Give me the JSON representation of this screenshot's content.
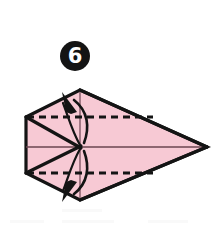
{
  "figure": {
    "kind": "origami-instruction-diagram",
    "step_number": "6",
    "step_badge": {
      "label": "6",
      "shape": "filled-circle",
      "fill_color": "#141414",
      "text_color": "#ffffff",
      "center": [
        75,
        56
      ],
      "radius": 15
    },
    "canvas": {
      "width": 222,
      "height": 228,
      "background_color": "#ffffff"
    },
    "paper": {
      "name": "kite-base-paper",
      "fill_color": "#f7c9d4",
      "outline_color": "#141414",
      "outline_width": 3.2,
      "outline_points": "26,117 80,90 207,147 80,200 26,173",
      "vertices": [
        {
          "name": "left-top-corner",
          "x": 26,
          "y": 117
        },
        {
          "name": "top-vertex",
          "x": 80,
          "y": 90
        },
        {
          "name": "right-tip",
          "x": 207,
          "y": 147
        },
        {
          "name": "bottom-vertex",
          "x": 80,
          "y": 200
        },
        {
          "name": "left-bottom-corner",
          "x": 26,
          "y": 173
        }
      ]
    },
    "center_point": {
      "name": "convergence-point",
      "x": 80,
      "y": 147
    },
    "lines": {
      "center_horizontal": {
        "name": "center-crease-line",
        "style": "solid",
        "color": "#3a2128",
        "width": 1.6,
        "x1": 26,
        "y1": 147,
        "x2": 207,
        "y2": 147
      },
      "upper_diagonal_edge": {
        "name": "upper-flap-edge",
        "style": "solid",
        "color": "#141414",
        "width": 3.2,
        "x1": 26,
        "y1": 117,
        "x2": 80,
        "y2": 147
      },
      "lower_diagonal_edge": {
        "name": "lower-flap-edge",
        "style": "solid",
        "color": "#141414",
        "width": 3.2,
        "x1": 26,
        "y1": 173,
        "x2": 80,
        "y2": 147
      },
      "upper_long_edge": {
        "name": "upper-long-crease",
        "style": "solid",
        "color": "#141414",
        "width": 3.2,
        "x1": 80,
        "y1": 90,
        "x2": 207,
        "y2": 147
      },
      "lower_long_edge": {
        "name": "lower-long-crease",
        "style": "solid",
        "color": "#141414",
        "width": 3.2,
        "x1": 80,
        "y1": 200,
        "x2": 207,
        "y2": 147
      },
      "vertical_center_axis": {
        "name": "vertical-center-axis",
        "style": "solid",
        "color": "#6b4450",
        "width": 1.2,
        "x1": 80,
        "y1": 90,
        "x2": 80,
        "y2": 200
      }
    },
    "fold_lines": [
      {
        "name": "upper-valley-fold-line",
        "style": "dashed",
        "color": "#141414",
        "width": 2.8,
        "dash": "7,5",
        "x1": 27,
        "y1": 117,
        "x2": 153,
        "y2": 117
      },
      {
        "name": "lower-valley-fold-line",
        "style": "dashed",
        "color": "#141414",
        "width": 2.8,
        "dash": "7,5",
        "x1": 27,
        "y1": 173,
        "x2": 153,
        "y2": 173
      }
    ],
    "arrows": [
      {
        "name": "upper-fold-arrow",
        "direction": "up",
        "color": "#141414",
        "shaft_path": "M 84,142 C 88,128 87,112 73,101",
        "shaft_width": 2.6,
        "head_points": "64,93 78,110 73,113 69,113",
        "head_rotation": -28
      },
      {
        "name": "lower-fold-arrow",
        "direction": "down",
        "color": "#141414",
        "shaft_path": "M 84,152 C 88,166 87,182 73,192",
        "shaft_width": 2.6,
        "head_points": "64,200 78,183 73,180 69,180",
        "head_rotation": 28
      },
      {
        "name": "upper-crease-hint-stroke",
        "direction": "up-inner",
        "color": "#141414",
        "shaft_path": "M 79,144 C 70,130 67,114 62,101",
        "shaft_width": 2.2
      },
      {
        "name": "lower-crease-hint-stroke",
        "direction": "down-inner",
        "color": "#141414",
        "shaft_path": "M 79,150 C 70,164 67,180 62,192",
        "shaft_width": 2.2
      }
    ],
    "colors": {
      "paper_pink": "#f7c9d4",
      "ink_black": "#141414",
      "crease_maroon": "#6b4450",
      "page_white": "#ffffff"
    }
  }
}
